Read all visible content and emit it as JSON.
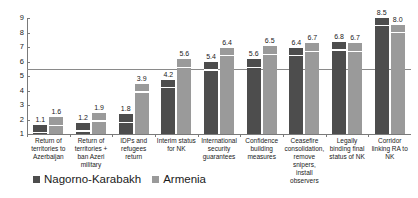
{
  "chart_data": {
    "type": "bar",
    "title": "",
    "subtitle": "",
    "xlabel": "",
    "ylabel": "",
    "ylim": [
      1,
      9
    ],
    "yticks": [
      1,
      2,
      3,
      4,
      5,
      6,
      7,
      8,
      9
    ],
    "grid": false,
    "legend_position": "bottom-left",
    "reference_line": 5.5,
    "categories": [
      "Return of territories to Azerbaijan",
      "Return of territories + ban Azeri military",
      "IDPs and refugees return",
      "Interim status for NK",
      "International security guarantees",
      "Confidence building measures",
      "Ceasefire consolidation, remove snipers, install observers",
      "Legally binding final status of NK",
      "Corridor linking RA to NK"
    ],
    "category_lines": [
      [
        "Return of",
        "territories to",
        "Azerbaijan"
      ],
      [
        "Return of",
        "territories +",
        "ban Azeri",
        "military"
      ],
      [
        "IDPs and",
        "refugees",
        "return"
      ],
      [
        "Interim status",
        "for NK"
      ],
      [
        "International",
        "security",
        "guarantees"
      ],
      [
        "Confidence",
        "building",
        "measures"
      ],
      [
        "Ceasefire",
        "consolidation,",
        "remove",
        "snipers, install",
        "observers"
      ],
      [
        "Legally",
        "binding final",
        "status of NK"
      ],
      [
        "Corridor",
        "linking RA to",
        "NK"
      ]
    ],
    "series": [
      {
        "name": "Nagorno-Karabakh",
        "color": "#4d4d4d",
        "values": [
          1.1,
          1.2,
          1.8,
          4.2,
          5.4,
          5.6,
          6.4,
          6.8,
          8.5
        ],
        "labels": [
          "1.1",
          "1.2",
          "1.8",
          "4.2",
          "5.4",
          "5.6",
          "6.4",
          "6.8",
          "8.5"
        ]
      },
      {
        "name": "Armenia",
        "color": "#9a9a9a",
        "values": [
          1.6,
          1.9,
          3.9,
          5.6,
          6.4,
          6.5,
          6.7,
          6.7,
          8.0
        ],
        "labels": [
          "1.6",
          "1.9",
          "3.9",
          "5.6",
          "6.4",
          "6.5",
          "6.7",
          "6.7",
          "8.0"
        ]
      }
    ]
  },
  "legend": {
    "items": [
      {
        "label": "Nagorno-Karabakh",
        "color": "#4d4d4d"
      },
      {
        "label": "Armenia",
        "color": "#9a9a9a"
      }
    ]
  }
}
